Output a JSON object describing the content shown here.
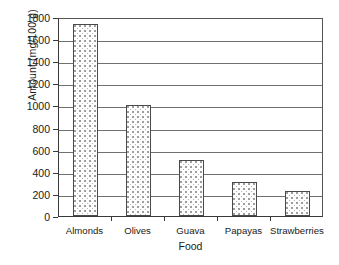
{
  "chart_data": {
    "type": "bar",
    "title": "",
    "xlabel": "Food",
    "ylabel": "Amount (mg/100 g)",
    "categories": [
      "Almonds",
      "Olives",
      "Guava",
      "Papayas",
      "Strawberries"
    ],
    "values": [
      1740,
      1000,
      510,
      305,
      225
    ],
    "ylim": [
      0,
      1800
    ],
    "ytick_labels": [
      "1800",
      "1600",
      "1400",
      "1200",
      "1000",
      "800",
      "600",
      "400",
      "200",
      "0"
    ],
    "ytick_values": [
      1800,
      1600,
      1400,
      1200,
      1000,
      800,
      600,
      400,
      200,
      0
    ],
    "ytick_step": 200,
    "grid": true,
    "grid_axis": "y",
    "legend": false,
    "legend_position": "none",
    "bar_fill": "#fdfdfd",
    "bar_pattern": "dotted-stipple",
    "bar_edge_color": "#4a4a4a",
    "gridline_color": "#707070",
    "axis_color": "#3a3a3a",
    "background": "#ffffff"
  }
}
